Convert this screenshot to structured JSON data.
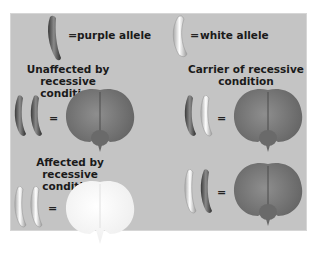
{
  "legend": {
    "purple_allele": {
      "symbol": "=",
      "label": "purple allele"
    },
    "white_allele": {
      "symbol": "=",
      "label": "white allele"
    }
  },
  "cases": [
    {
      "title_line1": "Unaffected by recessive",
      "title_line2": "condition",
      "alleles": [
        "purple",
        "purple"
      ],
      "equals": "=",
      "flower": "purple"
    },
    {
      "title_line1": "Carrier of recessive",
      "title_line2": "condition",
      "alleles": [
        "purple",
        "white"
      ],
      "equals": "=",
      "flower": "purple"
    },
    {
      "title_line1": "Affected by recessive",
      "title_line2": "condition",
      "alleles": [
        "white",
        "white"
      ],
      "equals": "=",
      "flower": "white"
    },
    {
      "title_line1": "",
      "title_line2": "",
      "alleles": [
        "white",
        "purple"
      ],
      "equals": "=",
      "flower": "purple"
    }
  ],
  "colors": {
    "panel": "#c4c4c4",
    "purple_allele": "#5a5a5a",
    "white_allele": "#f0f0f0",
    "purple_flower": "#777777",
    "white_flower": "#fbfbfb"
  }
}
